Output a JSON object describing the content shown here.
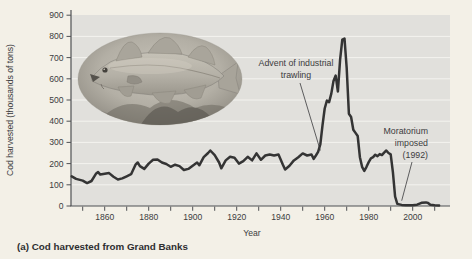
{
  "caption": "(a) Cod harvested from Grand Banks",
  "colors": {
    "page_bg": "#f3f0e7",
    "plot_bg": "#e1e0dc",
    "gridline": "#f4f3ef",
    "axis": "#4f5154",
    "text": "#3c3c3e",
    "curve": "#343434"
  },
  "inset": {
    "image_name": "cod-fish-photo-oval"
  },
  "chart_data": {
    "type": "line",
    "title": "",
    "xlabel": "Year",
    "ylabel": "Cod harvested (thousands of tons)",
    "xlim": [
      1845,
      2017
    ],
    "ylim": [
      0,
      900
    ],
    "grid": "horizontal-white-lines",
    "legend": "none",
    "y_tick_interval": 100,
    "y_tick_labels": [
      "0",
      "100",
      "200",
      "300",
      "400",
      "500",
      "600",
      "700",
      "800",
      "900"
    ],
    "x_minor_tick_start": 1850,
    "x_minor_tick_end": 2010,
    "x_minor_tick_interval": 10,
    "x_labeled_ticks": [
      1860,
      1880,
      1900,
      1920,
      1940,
      1960,
      1980,
      2000
    ],
    "x_tick_labels": [
      "1860",
      "1880",
      "1900",
      "1920",
      "1940",
      "1960",
      "1980",
      "2000"
    ],
    "series": [
      {
        "name": "Cod harvested (thousands of tons)",
        "points": [
          [
            1845,
            140
          ],
          [
            1847,
            128
          ],
          [
            1850,
            120
          ],
          [
            1852,
            108
          ],
          [
            1854,
            118
          ],
          [
            1856,
            152
          ],
          [
            1857,
            160
          ],
          [
            1858,
            148
          ],
          [
            1860,
            152
          ],
          [
            1862,
            155
          ],
          [
            1864,
            138
          ],
          [
            1866,
            125
          ],
          [
            1868,
            130
          ],
          [
            1870,
            140
          ],
          [
            1872,
            150
          ],
          [
            1874,
            195
          ],
          [
            1875,
            205
          ],
          [
            1876,
            188
          ],
          [
            1878,
            175
          ],
          [
            1880,
            200
          ],
          [
            1882,
            218
          ],
          [
            1884,
            220
          ],
          [
            1886,
            205
          ],
          [
            1888,
            198
          ],
          [
            1890,
            185
          ],
          [
            1892,
            195
          ],
          [
            1894,
            188
          ],
          [
            1896,
            170
          ],
          [
            1898,
            175
          ],
          [
            1900,
            190
          ],
          [
            1902,
            205
          ],
          [
            1903,
            192
          ],
          [
            1905,
            230
          ],
          [
            1907,
            250
          ],
          [
            1908,
            262
          ],
          [
            1910,
            240
          ],
          [
            1912,
            205
          ],
          [
            1913,
            178
          ],
          [
            1915,
            215
          ],
          [
            1917,
            232
          ],
          [
            1919,
            228
          ],
          [
            1921,
            200
          ],
          [
            1923,
            212
          ],
          [
            1925,
            232
          ],
          [
            1927,
            215
          ],
          [
            1929,
            248
          ],
          [
            1931,
            218
          ],
          [
            1933,
            238
          ],
          [
            1935,
            243
          ],
          [
            1937,
            238
          ],
          [
            1939,
            243
          ],
          [
            1941,
            195
          ],
          [
            1942,
            172
          ],
          [
            1944,
            190
          ],
          [
            1946,
            215
          ],
          [
            1948,
            230
          ],
          [
            1950,
            248
          ],
          [
            1952,
            238
          ],
          [
            1954,
            243
          ],
          [
            1955,
            222
          ],
          [
            1956,
            238
          ],
          [
            1957,
            255
          ],
          [
            1958,
            290
          ],
          [
            1959,
            380
          ],
          [
            1960,
            460
          ],
          [
            1961,
            497
          ],
          [
            1962,
            490
          ],
          [
            1963,
            530
          ],
          [
            1964,
            590
          ],
          [
            1965,
            615
          ],
          [
            1966,
            540
          ],
          [
            1967,
            690
          ],
          [
            1968,
            785
          ],
          [
            1969,
            790
          ],
          [
            1970,
            650
          ],
          [
            1971,
            435
          ],
          [
            1972,
            420
          ],
          [
            1973,
            360
          ],
          [
            1974,
            345
          ],
          [
            1975,
            330
          ],
          [
            1976,
            230
          ],
          [
            1977,
            185
          ],
          [
            1978,
            165
          ],
          [
            1979,
            185
          ],
          [
            1980,
            207
          ],
          [
            1981,
            225
          ],
          [
            1982,
            230
          ],
          [
            1983,
            242
          ],
          [
            1984,
            235
          ],
          [
            1985,
            245
          ],
          [
            1986,
            240
          ],
          [
            1987,
            252
          ],
          [
            1988,
            262
          ],
          [
            1989,
            250
          ],
          [
            1990,
            244
          ],
          [
            1991,
            160
          ],
          [
            1992,
            45
          ],
          [
            1993,
            10
          ],
          [
            1995,
            5
          ],
          [
            1997,
            4
          ],
          [
            2000,
            4
          ],
          [
            2002,
            6
          ],
          [
            2004,
            15
          ],
          [
            2006,
            17
          ],
          [
            2007,
            14
          ],
          [
            2008,
            6
          ],
          [
            2010,
            4
          ],
          [
            2012,
            3
          ]
        ]
      }
    ],
    "annotations": [
      {
        "id": "advent",
        "text": "Advent of industrial trawling",
        "lines": [
          "Advent of industrial",
          "trawling"
        ],
        "arrow_to": [
          1958,
          262
        ]
      },
      {
        "id": "moratorium",
        "text": "Moratorium imposed (1992)",
        "lines": [
          "Moratorium",
          "imposed",
          "(1992)"
        ],
        "arrow_to": [
          1995,
          25
        ]
      }
    ]
  }
}
